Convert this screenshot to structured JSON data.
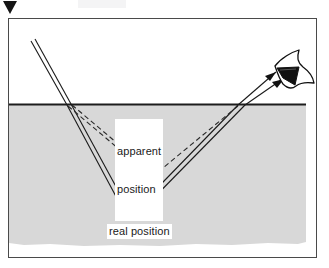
{
  "figure": {
    "name": "refraction-apparent-position-diagram",
    "page_marker_icon": "down-triangle-marker",
    "frame": {
      "x": 8,
      "y": 18,
      "width": 309,
      "height": 240
    },
    "colors": {
      "frame_border": "#4a4a4a",
      "water_surface_line": "#1d1d1d",
      "water_fill": "#d8d8d8",
      "ray_stroke": "#1a1a1a",
      "dashed_ray_stroke": "#2a2a2a",
      "label_background": "#ffffff",
      "label_text": "#1a1a1a",
      "eye_outline": "#111111",
      "eye_lens_fill": "#111111",
      "page_marker": "#151515"
    },
    "water": {
      "surface_y": 104,
      "surface_x_start": 9,
      "surface_x_end": 306,
      "fill_top": 105,
      "fill_bottom": 246
    },
    "labels": {
      "apparent_position": "apparent\nposition",
      "apparent_position_line1": "apparent",
      "apparent_position_line2": "position",
      "real_position": "real position"
    },
    "points": {
      "real_position": {
        "x": 130,
        "y": 216
      },
      "apparent_position": {
        "x": 152,
        "y": 176
      },
      "entry_left": {
        "x": 67,
        "y": 105
      },
      "exit_right": {
        "x": 238,
        "y": 105
      },
      "eye": {
        "x": 292,
        "y": 68
      }
    },
    "rays": {
      "incident_pair_label": "incident light rays from above water",
      "refracted_down_label": "rays refracted into water toward real position",
      "outgoing_pair_label": "rays from real position refracted out to the eye",
      "dashed_label": "dashed back-projection lines to apparent position",
      "arrowheads": 2
    },
    "eye": {
      "icon": "eye-icon",
      "description": "observer eye viewing from above the water surface"
    }
  }
}
